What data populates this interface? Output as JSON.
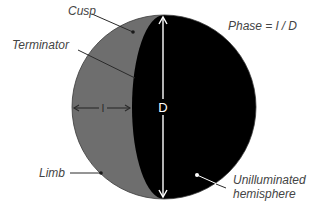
{
  "diagram": {
    "title": "Phase = l / D",
    "labels": {
      "cusp": "Cusp",
      "terminator": "Terminator",
      "limb": "Limb",
      "unilluminated_line1": "Unilluminated",
      "unilluminated_line2": "hemisphere",
      "l": "l",
      "d": "D"
    },
    "colors": {
      "illuminated": "#6e6e6e",
      "unilluminated": "#000000",
      "label_text": "#444444",
      "arrow_dark": "#2a2a2a",
      "arrow_light": "#ffffff"
    }
  }
}
